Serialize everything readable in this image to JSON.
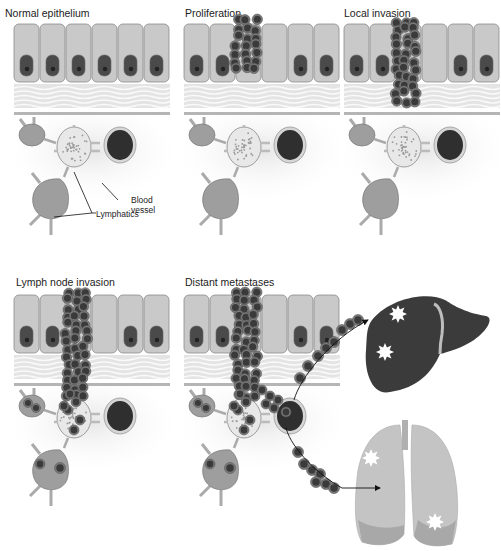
{
  "figure": {
    "panels": [
      {
        "id": "normal",
        "title": "Normal epithelium",
        "stage": 0
      },
      {
        "id": "proliferation",
        "title": "Proliferation",
        "stage": 1
      },
      {
        "id": "local-invasion",
        "title": "Local invasion",
        "stage": 2
      },
      {
        "id": "lymph-node-invasion",
        "title": "Lymph node invasion",
        "stage": 3
      },
      {
        "id": "distant-metastases",
        "title": "Distant metastases",
        "stage": 4
      }
    ],
    "labels": {
      "blood_vessel_line1": "Blood",
      "blood_vessel_line2": "vessel",
      "lymphatics": "Lymphatics"
    },
    "organs": {
      "liver": {
        "name": "liver",
        "metastases_count": 2
      },
      "lungs": {
        "name": "lungs",
        "metastases_count": 2
      }
    },
    "colors": {
      "cell_fill": "#c9c9c9",
      "cell_stroke": "#8a8a8a",
      "nucleus": "#4a4a4a",
      "tumor_cell": "#3a3a3a",
      "tumor_cell_rim": "#7a7a7a",
      "stroma": "#e4e4e4",
      "basement": "#b5b5b5",
      "lymph_node": "#9e9e9e",
      "blood_vessel": "#2f2f2f",
      "liver": "#3b3b3b",
      "lungs": "#c4c4c4",
      "metastasis": "#ffffff"
    }
  }
}
